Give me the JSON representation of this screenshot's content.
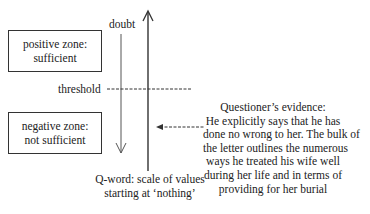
{
  "diagram": {
    "positive_box": {
      "line1": "positive zone:",
      "line2": "sufficient"
    },
    "negative_box": {
      "line1": "negative zone:",
      "line2": "not sufficient"
    },
    "doubt_label": "doubt",
    "threshold_label": "threshold",
    "scale_caption": {
      "line1": "Q-word: scale of values",
      "line2": "starting at ‘nothing’"
    },
    "evidence": {
      "lines": [
        "Questioner’s evidence:",
        "He explicitly says that he has",
        "done no wrong to her. The bulk of",
        "the letter outlines the numerous",
        "ways he treated his wife well",
        "during her life and in terms of",
        "providing for her burial"
      ]
    },
    "colors": {
      "line": "#333333",
      "text": "#222222",
      "background": "#ffffff"
    }
  }
}
